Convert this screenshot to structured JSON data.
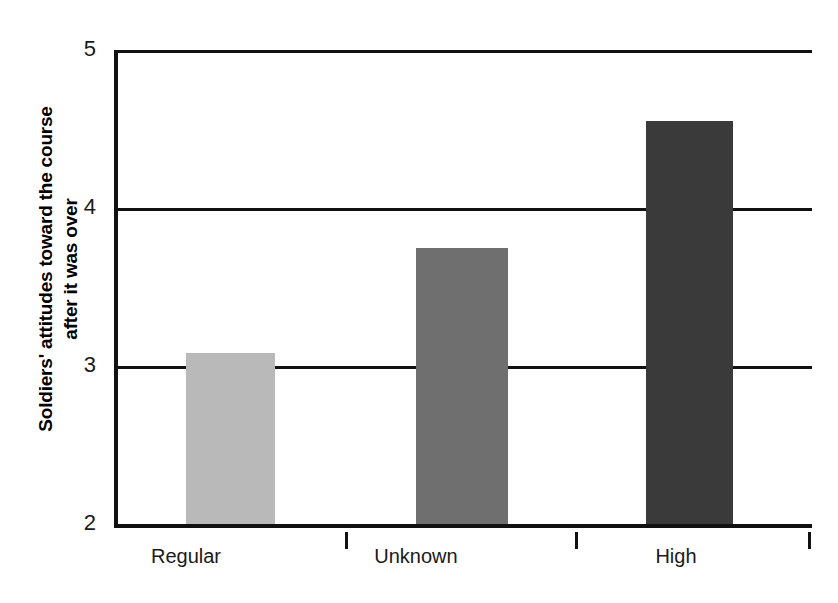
{
  "chart_data": {
    "type": "bar",
    "title": "",
    "subtitle": "",
    "xlabel": "",
    "ylabel": "Soldiers' attitudes toward the course\nafter it was over",
    "ylabel_line1": "Soldiers' attitudes toward the course",
    "ylabel_line2": "after it was over",
    "categories": [
      "Regular",
      "Unknown",
      "High"
    ],
    "values": [
      3.08,
      3.75,
      4.55
    ],
    "series": [
      {
        "name": "Soldiers' attitudes",
        "values": [
          3.08,
          3.75,
          4.55
        ]
      }
    ],
    "ylim": [
      2,
      5
    ],
    "yticks": [
      2,
      3,
      4,
      5
    ],
    "ytick_labels": [
      "2",
      "3",
      "4",
      "5"
    ],
    "grid": "horizontal",
    "legend": "none",
    "bar_colors": [
      "#b9b9b9",
      "#6f6f6f",
      "#3a3a3a"
    ],
    "axis_color": "#111111",
    "background": "#ffffff",
    "annotations": []
  },
  "axis": {
    "y_title_line1": "Soldiers' attitudes toward the course",
    "y_title_line2": "after it was over",
    "tick_5": "5",
    "tick_4": "4",
    "tick_3": "3",
    "tick_2": "2"
  },
  "bars": [
    {
      "label": "Regular",
      "value": 3.08,
      "color": "#b9b9b9"
    },
    {
      "label": "Unknown",
      "value": 3.75,
      "color": "#6f6f6f"
    },
    {
      "label": "High",
      "value": 4.55,
      "color": "#3a3a3a"
    }
  ]
}
